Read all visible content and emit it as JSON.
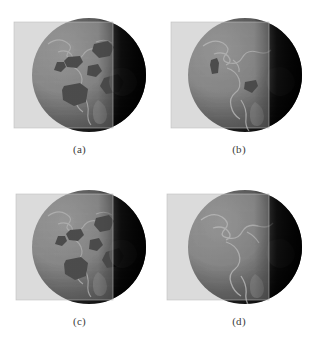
{
  "figure": {
    "kind": "multi-panel-volume-rendering",
    "background_color": "#ffffff",
    "panel_count": 4,
    "layout": "2x2",
    "shared": {
      "subject": "earth-globe-volume-render",
      "cut_plane": "translucent-axis-aligned-slicing-plane",
      "globe_lit_side_color": "#6e6e6e",
      "globe_dark_side_color": "#0a0a0a",
      "globe_terminator_color": "#2a2a2a",
      "plane_color": "#d6d6d6",
      "plane_opacity": "0.62",
      "coastline_color": "#a8a8a8",
      "blob_color": "#101010",
      "caption_color": "#3a3a3a"
    },
    "panels": [
      {
        "id": "a",
        "caption": "(a)",
        "detail_level": "coarse",
        "blob_count": 6,
        "plane_left": 14,
        "plane_right": 113,
        "plane_top": 22,
        "plane_bottom": 128,
        "globe_cx": 89,
        "globe_cy": 75,
        "globe_r": 57
      },
      {
        "id": "b",
        "caption": "(b)",
        "detail_level": "refined",
        "blob_count": 2,
        "plane_left": 12,
        "plane_right": 110,
        "plane_top": 22,
        "plane_bottom": 128,
        "globe_cx": 86,
        "globe_cy": 75,
        "globe_r": 57
      },
      {
        "id": "c",
        "caption": "(c)",
        "detail_level": "coarse",
        "blob_count": 6,
        "plane_left": 16,
        "plane_right": 113,
        "plane_top": 22,
        "plane_bottom": 128,
        "globe_cx": 89,
        "globe_cy": 75,
        "globe_r": 57
      },
      {
        "id": "d",
        "caption": "(d)",
        "detail_level": "smooth",
        "blob_count": 0,
        "plane_left": 8,
        "plane_right": 110,
        "plane_top": 22,
        "plane_bottom": 128,
        "globe_cx": 86,
        "globe_cy": 75,
        "globe_r": 57
      }
    ]
  }
}
